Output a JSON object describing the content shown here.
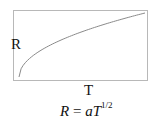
{
  "chart_data": {
    "type": "line",
    "title": "",
    "xlabel": "T",
    "ylabel": "R",
    "grid": false,
    "legend": null,
    "series": [
      {
        "name": "R = aT^(1/2)",
        "function": "sqrt",
        "x": [
          0,
          0.1,
          0.2,
          0.3,
          0.4,
          0.5,
          0.6,
          0.7,
          0.8,
          0.9,
          1.0
        ],
        "values": [
          0,
          0.32,
          0.45,
          0.55,
          0.63,
          0.71,
          0.77,
          0.84,
          0.89,
          0.95,
          1.0
        ]
      }
    ],
    "annotations": [
      "R = aT^1/2"
    ]
  },
  "diagram": {
    "y_axis_label": "R",
    "x_axis_label": "T",
    "equation": {
      "lhs": "R",
      "eq": " = ",
      "coef": "a",
      "var": "T",
      "exponent": "1/2"
    },
    "colors": {
      "frame": "#b8b8b8",
      "curve": "#8a8a8a",
      "text": "#111111"
    }
  }
}
